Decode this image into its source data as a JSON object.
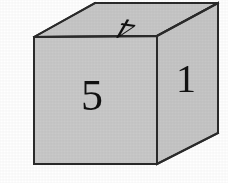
{
  "figure": {
    "background_color": "#ffffff",
    "canvas": {
      "width": 228,
      "height": 183
    }
  },
  "cube": {
    "face_fill_color": "#c9c9c9",
    "top_face_fill_color": "#c7c7c7",
    "right_face_fill_color": "#c6c6c6",
    "edge_color": "#2a2a2a",
    "edge_width": 2,
    "geometry": {
      "front_top_left": [
        34,
        37
      ],
      "front_top_right": [
        157,
        36
      ],
      "front_bottom_right": [
        157,
        164
      ],
      "front_bottom_left": [
        34,
        164
      ],
      "back_top_left": [
        95,
        3
      ],
      "back_top_right": [
        218,
        3
      ],
      "back_bottom_right": [
        218,
        133
      ]
    },
    "faces": [
      {
        "name": "front-face",
        "label": "5",
        "label_x": 92,
        "label_y": 110,
        "label_size": 44,
        "label_rotation": 0,
        "label_skew": 0
      },
      {
        "name": "right-face",
        "label": "1",
        "label_x": 186,
        "label_y": 92,
        "label_size": 40,
        "label_rotation": 0,
        "label_skew": 0
      },
      {
        "name": "top-face",
        "label": "4",
        "label_x": 131,
        "label_y": 20,
        "label_size": 30,
        "label_rotation": 188,
        "label_skew": -22
      }
    ]
  }
}
